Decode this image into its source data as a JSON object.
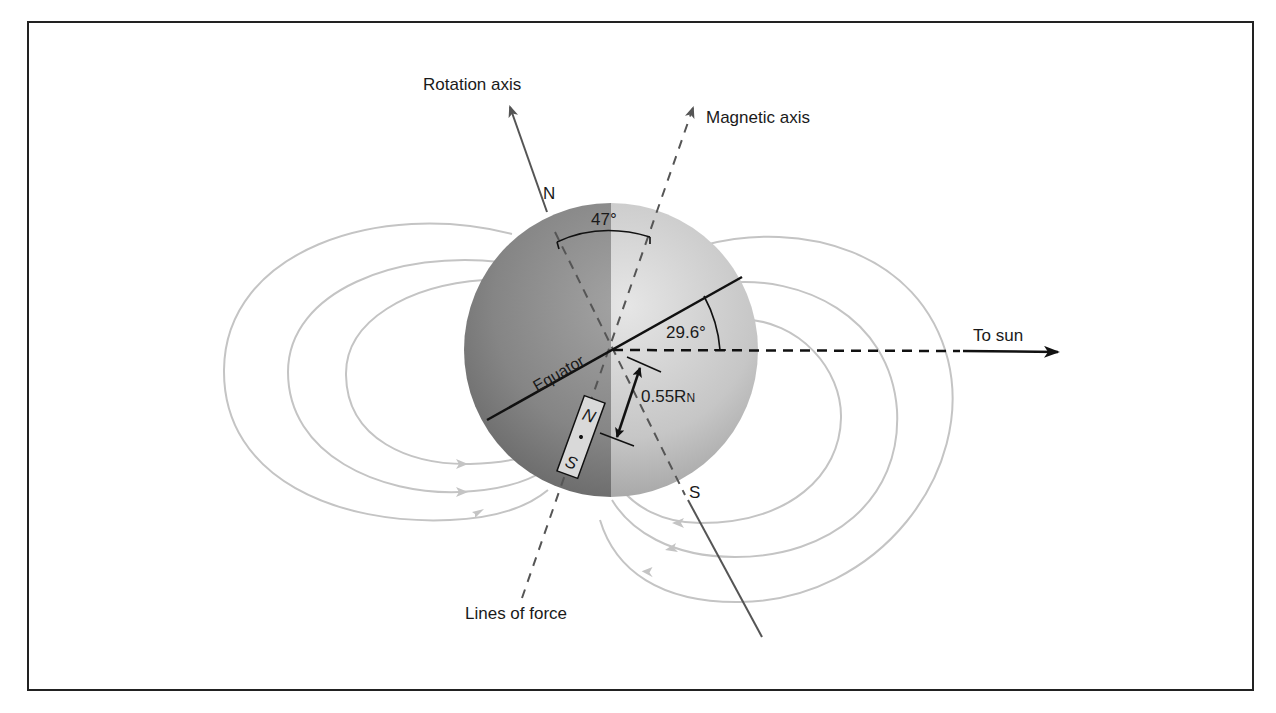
{
  "figure": {
    "type": "neptune-magnetic-field-diagram",
    "labels": {
      "rotation_axis": "Rotation axis",
      "magnetic_axis": "Magnetic axis",
      "to_sun": "To sun",
      "lines_of_force": "Lines of force",
      "equator": "Equator",
      "north_pole": "N",
      "south_pole": "S",
      "tilt_angle": "47°",
      "equator_sun_angle": "29.6°",
      "offset_value": "0.55R",
      "offset_subscript": "N",
      "magnet_north": "N",
      "magnet_south": "S"
    },
    "colors": {
      "frame": "#222222",
      "field_lines": "#c4c4c4",
      "planet_dark": "#7a7a7a",
      "planet_light": "#c8c8c8",
      "axis_line": "#555555",
      "ink": "#111111"
    },
    "values": {
      "magnetic_tilt_deg": 47,
      "equator_to_sun_deg": 29.6,
      "dipole_offset_radii": 0.55
    }
  }
}
